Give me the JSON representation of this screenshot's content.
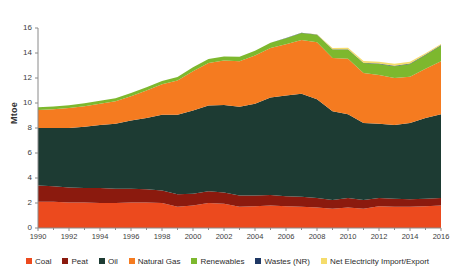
{
  "chart_data": {
    "type": "area",
    "stacked": true,
    "title": "",
    "subtitle": "",
    "xlabel": "",
    "ylabel": "Mtoe",
    "ylim": [
      0,
      16
    ],
    "xlim": [
      1990,
      2016
    ],
    "grid": false,
    "legend_position": "bottom",
    "y_ticks": [
      0,
      2,
      4,
      6,
      8,
      10,
      12,
      14,
      16
    ],
    "y_tick_labels": [
      "0",
      "2",
      "4",
      "6",
      "8",
      "10",
      "12",
      "14",
      "16"
    ],
    "x_ticks": [
      1990,
      1992,
      1994,
      1996,
      1998,
      2000,
      2002,
      2004,
      2006,
      2008,
      2010,
      2012,
      2014,
      2016
    ],
    "x_tick_labels": [
      "1990",
      "1992",
      "1994",
      "1996",
      "1998",
      "2000",
      "2002",
      "2004",
      "2006",
      "2008",
      "2010",
      "2012",
      "2014",
      "2016"
    ],
    "x": [
      1990,
      1991,
      1992,
      1993,
      1994,
      1995,
      1996,
      1997,
      1998,
      1999,
      2000,
      2001,
      2002,
      2003,
      2004,
      2005,
      2006,
      2007,
      2008,
      2009,
      2010,
      2011,
      2012,
      2013,
      2014,
      2015,
      2016
    ],
    "series": [
      {
        "name": "Coal",
        "color": "#EC4A1E",
        "values": [
          2.1,
          2.1,
          2.05,
          2.05,
          2.0,
          2.0,
          2.05,
          2.05,
          2.0,
          1.7,
          1.8,
          2.0,
          1.95,
          1.7,
          1.75,
          1.8,
          1.75,
          1.7,
          1.65,
          1.55,
          1.65,
          1.55,
          1.75,
          1.7,
          1.7,
          1.75,
          1.8
        ]
      },
      {
        "name": "Peat",
        "color": "#8B1A0E",
        "values": [
          1.3,
          1.25,
          1.2,
          1.15,
          1.2,
          1.15,
          1.1,
          1.05,
          1.0,
          1.0,
          0.95,
          0.95,
          0.9,
          0.9,
          0.85,
          0.85,
          0.8,
          0.8,
          0.75,
          0.7,
          0.75,
          0.7,
          0.65,
          0.65,
          0.6,
          0.6,
          0.6
        ]
      },
      {
        "name": "Oil",
        "color": "#1D3B33",
        "values": [
          4.6,
          4.65,
          4.75,
          4.9,
          5.05,
          5.2,
          5.45,
          5.7,
          6.05,
          6.35,
          6.65,
          6.85,
          7.0,
          7.1,
          7.35,
          7.8,
          8.05,
          8.25,
          7.9,
          7.1,
          6.7,
          6.15,
          5.95,
          5.9,
          6.1,
          6.45,
          6.7
        ]
      },
      {
        "name": "Natural Gas",
        "color": "#F57B20",
        "values": [
          1.45,
          1.5,
          1.6,
          1.65,
          1.7,
          1.8,
          1.95,
          2.2,
          2.45,
          2.75,
          3.15,
          3.4,
          3.55,
          3.65,
          3.85,
          3.95,
          4.1,
          4.3,
          4.55,
          4.25,
          4.45,
          4.0,
          3.9,
          3.75,
          3.7,
          3.95,
          4.25
        ]
      },
      {
        "name": "Renewables",
        "color": "#7DB82E",
        "values": [
          0.22,
          0.22,
          0.22,
          0.23,
          0.23,
          0.24,
          0.25,
          0.26,
          0.27,
          0.28,
          0.3,
          0.31,
          0.33,
          0.35,
          0.38,
          0.42,
          0.48,
          0.55,
          0.62,
          0.68,
          0.72,
          0.8,
          0.88,
          0.95,
          1.02,
          1.1,
          1.25
        ]
      },
      {
        "name": "Wastes (NR)",
        "color": "#1F3864",
        "values": [
          0.0,
          0.0,
          0.0,
          0.0,
          0.0,
          0.0,
          0.0,
          0.0,
          0.0,
          0.0,
          0.0,
          0.0,
          0.0,
          0.0,
          0.0,
          0.01,
          0.01,
          0.02,
          0.02,
          0.02,
          0.03,
          0.03,
          0.03,
          0.04,
          0.04,
          0.04,
          0.05
        ]
      },
      {
        "name": "Net Electricity Import/Export",
        "color": "#F5DC6B",
        "values": [
          0.0,
          0.0,
          0.0,
          0.0,
          0.0,
          0.0,
          0.0,
          0.0,
          0.0,
          0.0,
          0.0,
          0.0,
          0.0,
          0.0,
          0.0,
          0.0,
          0.0,
          0.0,
          0.02,
          0.1,
          0.12,
          0.14,
          0.15,
          0.16,
          0.14,
          0.1,
          0.08
        ]
      }
    ]
  },
  "legend": {
    "items": [
      {
        "label": "Coal",
        "color": "#EC4A1E"
      },
      {
        "label": "Peat",
        "color": "#8B1A0E"
      },
      {
        "label": "Oil",
        "color": "#1D3B33"
      },
      {
        "label": "Natural Gas",
        "color": "#F57B20"
      },
      {
        "label": "Renewables",
        "color": "#7DB82E"
      },
      {
        "label": "Wastes (NR)",
        "color": "#1F3864"
      },
      {
        "label": "Net Electricity Import/Export",
        "color": "#F5DC6B"
      }
    ]
  },
  "axes": {
    "y_axis_label": "Mtoe",
    "axis_color": "#8a8a8a"
  }
}
